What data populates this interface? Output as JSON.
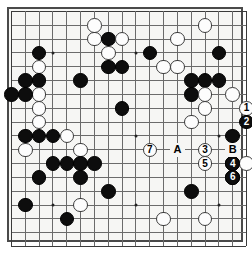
{
  "widget": {
    "title": "go-board-diagram",
    "board_size": 19,
    "visible_cols": 18,
    "visible_rows": 18,
    "background_color": "#f6f6f4",
    "line_color": "#6b6b6b",
    "border_color": "#3a3a3a",
    "black_color": "#0d0d0d",
    "white_color": "#fdfdfd"
  },
  "geometry": {
    "origin_x": 11,
    "origin_y": 11,
    "step": 13.83,
    "cols": 17,
    "rows": 17,
    "stone_diameter": 14.6
  },
  "star_points": [
    {
      "c": 3,
      "r": 3
    },
    {
      "c": 9,
      "r": 3
    },
    {
      "c": 15,
      "r": 3
    },
    {
      "c": 3,
      "r": 9
    },
    {
      "c": 9,
      "r": 9
    },
    {
      "c": 15,
      "r": 9
    },
    {
      "c": 3,
      "r": 14
    },
    {
      "c": 9,
      "r": 14
    },
    {
      "c": 15,
      "r": 14
    }
  ],
  "stones": [
    {
      "c": 6,
      "r": 1,
      "color": "white"
    },
    {
      "c": 14,
      "r": 1,
      "color": "white"
    },
    {
      "c": 6,
      "r": 2,
      "color": "white"
    },
    {
      "c": 7,
      "r": 2,
      "color": "black"
    },
    {
      "c": 8,
      "r": 2,
      "color": "white"
    },
    {
      "c": 12,
      "r": 2,
      "color": "white"
    },
    {
      "c": 7,
      "r": 3,
      "color": "white"
    },
    {
      "c": 2,
      "r": 3,
      "color": "black"
    },
    {
      "c": 10,
      "r": 3,
      "color": "black"
    },
    {
      "c": 15,
      "r": 3,
      "color": "black"
    },
    {
      "c": 11,
      "r": 4,
      "color": "white"
    },
    {
      "c": 2,
      "r": 4,
      "color": "white"
    },
    {
      "c": 7,
      "r": 4,
      "color": "black"
    },
    {
      "c": 8,
      "r": 4,
      "color": "black"
    },
    {
      "c": 12,
      "r": 4,
      "color": "white"
    },
    {
      "c": 1,
      "r": 5,
      "color": "black"
    },
    {
      "c": 2,
      "r": 5,
      "color": "black"
    },
    {
      "c": 5,
      "r": 5,
      "color": "black"
    },
    {
      "c": 13,
      "r": 5,
      "color": "black"
    },
    {
      "c": 14,
      "r": 5,
      "color": "black"
    },
    {
      "c": 15,
      "r": 5,
      "color": "black"
    },
    {
      "c": 2,
      "r": 6,
      "color": "white"
    },
    {
      "c": 13,
      "r": 6,
      "color": "black"
    },
    {
      "c": 14,
      "r": 6,
      "color": "white"
    },
    {
      "c": 16,
      "r": 6,
      "color": "white"
    },
    {
      "c": 1,
      "r": 6,
      "color": "black"
    },
    {
      "c": 0,
      "r": 6,
      "color": "black"
    },
    {
      "c": 2,
      "r": 7,
      "color": "white"
    },
    {
      "c": 14,
      "r": 7,
      "color": "white"
    },
    {
      "c": 8,
      "r": 7,
      "color": "black"
    },
    {
      "c": 2,
      "r": 8,
      "color": "white"
    },
    {
      "c": 13,
      "r": 8,
      "color": "white"
    },
    {
      "c": 1,
      "r": 9,
      "color": "black"
    },
    {
      "c": 2,
      "r": 9,
      "color": "black"
    },
    {
      "c": 3,
      "r": 9,
      "color": "black"
    },
    {
      "c": 4,
      "r": 9,
      "color": "white"
    },
    {
      "c": 16,
      "r": 9,
      "color": "black"
    },
    {
      "c": 5,
      "r": 10,
      "color": "white"
    },
    {
      "c": 1,
      "r": 10,
      "color": "white"
    },
    {
      "c": 16,
      "r": 10,
      "color": "white"
    },
    {
      "c": 3,
      "r": 11,
      "color": "black"
    },
    {
      "c": 4,
      "r": 11,
      "color": "black"
    },
    {
      "c": 5,
      "r": 11,
      "color": "black"
    },
    {
      "c": 6,
      "r": 11,
      "color": "black"
    },
    {
      "c": 16,
      "r": 11,
      "color": "black"
    },
    {
      "c": 17,
      "r": 11,
      "color": "white"
    },
    {
      "c": 2,
      "r": 12,
      "color": "black"
    },
    {
      "c": 5,
      "r": 12,
      "color": "black"
    },
    {
      "c": 16,
      "r": 12,
      "color": "black"
    },
    {
      "c": 7,
      "r": 13,
      "color": "black"
    },
    {
      "c": 13,
      "r": 13,
      "color": "black"
    },
    {
      "c": 1,
      "r": 14,
      "color": "black"
    },
    {
      "c": 5,
      "r": 14,
      "color": "white"
    },
    {
      "c": 4,
      "r": 15,
      "color": "black"
    },
    {
      "c": 11,
      "r": 15,
      "color": "white"
    },
    {
      "c": 14,
      "r": 15,
      "color": "white"
    }
  ],
  "move_markers": [
    {
      "number": "1",
      "c": 17,
      "r": 7,
      "color": "white",
      "c_adj": 0
    },
    {
      "number": "2",
      "c": 17,
      "r": 8,
      "color": "black"
    },
    {
      "number": "3",
      "c": 14,
      "r": 10,
      "color": "white"
    },
    {
      "number": "4",
      "c": 16,
      "r": 11,
      "color": "black"
    },
    {
      "number": "5",
      "c": 14,
      "r": 11,
      "color": "white"
    },
    {
      "number": "6",
      "c": 16,
      "r": 12,
      "color": "black"
    },
    {
      "number": "7",
      "c": 10,
      "r": 10,
      "color": "white"
    }
  ],
  "letter_labels": [
    {
      "letter": "A",
      "c": 12,
      "r": 10
    },
    {
      "letter": "B",
      "c": 16,
      "r": 10
    }
  ],
  "legend": {
    "numbered_moves": [
      "1",
      "2",
      "3",
      "4",
      "5",
      "6",
      "7"
    ],
    "marked_points": [
      "A",
      "B"
    ]
  }
}
